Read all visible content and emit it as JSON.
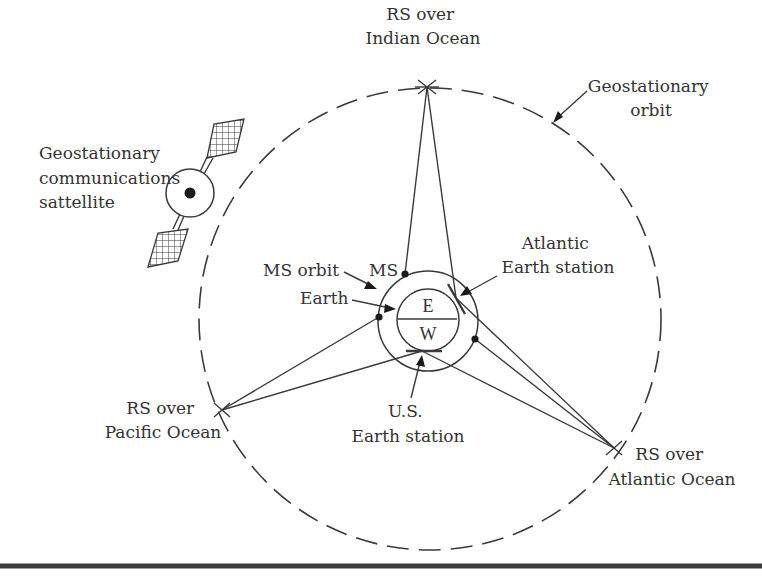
{
  "diagram": {
    "type": "satellite-relay-network",
    "labels": {
      "satellite": [
        "Geostationary",
        "communications",
        "sattellite"
      ],
      "rs_indian": [
        "RS over",
        "Indian Ocean"
      ],
      "geo_orbit": [
        "Geostationary",
        "orbit"
      ],
      "ms_orbit": "MS orbit",
      "ms": "MS",
      "earth": "Earth",
      "atlantic_station": [
        "Atlantic",
        "Earth station"
      ],
      "earth_east": "E",
      "earth_west": "W",
      "rs_pacific": [
        "RS over",
        "Pacific Ocean"
      ],
      "us_station": [
        "U.S.",
        "Earth station"
      ],
      "rs_atlantic": [
        "RS over",
        "Atlantic Ocean"
      ]
    },
    "nodes": [
      {
        "id": "rs_indian",
        "name": "RS over Indian Ocean",
        "x": 427,
        "y": 87
      },
      {
        "id": "rs_pacific",
        "name": "RS over Pacific Ocean",
        "x": 222,
        "y": 410
      },
      {
        "id": "rs_atlantic",
        "name": "RS over Atlantic Ocean",
        "x": 614,
        "y": 448
      },
      {
        "id": "us_station",
        "name": "U.S. Earth station",
        "x": 422,
        "y": 351
      },
      {
        "id": "atlantic_station",
        "name": "Atlantic Earth station",
        "x": 456,
        "y": 298
      },
      {
        "id": "ms_top",
        "name": "MS",
        "x": 405,
        "y": 274
      },
      {
        "id": "ms_left",
        "name": "MS",
        "x": 379,
        "y": 317
      },
      {
        "id": "ms_right",
        "name": "MS",
        "x": 475,
        "y": 339
      }
    ],
    "links": [
      [
        "rs_indian",
        "ms_top"
      ],
      [
        "rs_indian",
        "atlantic_station"
      ],
      [
        "rs_pacific",
        "ms_left"
      ],
      [
        "rs_pacific",
        "us_station"
      ],
      [
        "rs_atlantic",
        "us_station"
      ],
      [
        "rs_atlantic",
        "ms_right"
      ],
      [
        "rs_atlantic",
        "atlantic_station"
      ]
    ],
    "colors": {
      "line": "#3a3a3a",
      "text": "#333333",
      "background": "#ffffff"
    }
  }
}
